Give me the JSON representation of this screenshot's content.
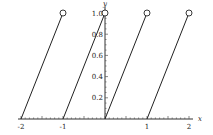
{
  "chart_data": {
    "type": "line",
    "title": "",
    "xlabel": "x",
    "ylabel": "y",
    "xlim": [
      -2,
      2
    ],
    "ylim": [
      0,
      1
    ],
    "x_ticks": [
      -2,
      -1,
      1,
      2
    ],
    "x_tick_labels": [
      "-2",
      "-1",
      "1",
      "2"
    ],
    "y_ticks": [
      0.2,
      0.4,
      0.6,
      0.8,
      1.0
    ],
    "y_tick_labels": [
      "0.2",
      "0.4",
      "0.6",
      "0.8",
      "1.0"
    ],
    "grid": false,
    "legend": null,
    "series": [
      {
        "name": "segment-1",
        "x": [
          -2,
          -1
        ],
        "y": [
          0,
          1
        ],
        "open_end": true
      },
      {
        "name": "segment-2",
        "x": [
          -1,
          0
        ],
        "y": [
          0,
          1
        ],
        "open_end": true
      },
      {
        "name": "segment-3",
        "x": [
          0,
          1
        ],
        "y": [
          0,
          1
        ],
        "open_end": true
      },
      {
        "name": "segment-4",
        "x": [
          1,
          2
        ],
        "y": [
          0,
          1
        ],
        "open_end": true
      }
    ]
  },
  "axes": {
    "x_label": "x",
    "y_label": "y"
  }
}
